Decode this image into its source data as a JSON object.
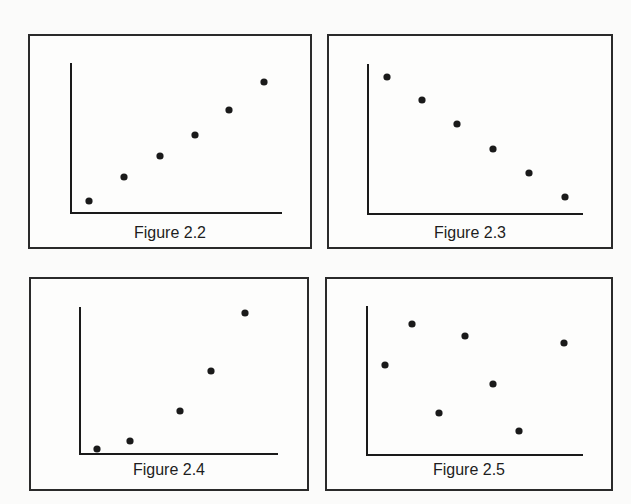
{
  "figures": [
    {
      "caption": "Figure 2.2"
    },
    {
      "caption": "Figure 2.3"
    },
    {
      "caption": "Figure 2.4"
    },
    {
      "caption": "Figure 2.5"
    }
  ],
  "colors": {
    "ink": "#1a1a1a",
    "border": "#2a2a2a",
    "background": "#fbfbfa"
  },
  "chart_data": [
    {
      "type": "scatter",
      "title": "Figure 2.2",
      "xlabel": "",
      "ylabel": "",
      "grid": false,
      "axes": {
        "origin": [
          71,
          213
        ],
        "x_end": 282,
        "y_top": 63
      },
      "points_px": [
        [
          89,
          201
        ],
        [
          124,
          177
        ],
        [
          160,
          156
        ],
        [
          195,
          135
        ],
        [
          229,
          110
        ],
        [
          264,
          82
        ]
      ],
      "x": [
        1,
        2,
        3,
        4,
        5,
        6
      ],
      "y": [
        1,
        2,
        3,
        4,
        5,
        6
      ],
      "note": "Positive linear relationship"
    },
    {
      "type": "scatter",
      "title": "Figure 2.3",
      "xlabel": "",
      "ylabel": "",
      "grid": false,
      "axes": {
        "origin": [
          368,
          214
        ],
        "x_end": 583,
        "y_top": 64
      },
      "points_px": [
        [
          387,
          77
        ],
        [
          422,
          100
        ],
        [
          457,
          124
        ],
        [
          493,
          149
        ],
        [
          529,
          173
        ],
        [
          565,
          197
        ]
      ],
      "x": [
        1,
        2,
        3,
        4,
        5,
        6
      ],
      "y": [
        6,
        5,
        4,
        3,
        2,
        1
      ],
      "note": "Negative linear relationship"
    },
    {
      "type": "scatter",
      "title": "Figure 2.4",
      "xlabel": "",
      "ylabel": "",
      "grid": false,
      "axes": {
        "origin": [
          80,
          454
        ],
        "x_end": 278,
        "y_top": 307
      },
      "points_px": [
        [
          97,
          449
        ],
        [
          130,
          441
        ],
        [
          180,
          411
        ],
        [
          211,
          371
        ],
        [
          245,
          313
        ]
      ],
      "x": [
        1,
        2,
        3.5,
        4.5,
        5.5
      ],
      "y": [
        0.2,
        0.5,
        1.5,
        2.9,
        4.8
      ],
      "note": "Positive curvilinear relationship"
    },
    {
      "type": "scatter",
      "title": "Figure 2.5",
      "xlabel": "",
      "ylabel": "",
      "grid": false,
      "axes": {
        "origin": [
          367,
          455
        ],
        "x_end": 583,
        "y_top": 306
      },
      "points_px": [
        [
          385,
          365
        ],
        [
          412,
          324
        ],
        [
          439,
          413
        ],
        [
          465,
          336
        ],
        [
          493,
          384
        ],
        [
          519,
          431
        ],
        [
          564,
          343
        ]
      ],
      "x": [
        1,
        2,
        3,
        4,
        5,
        6,
        7.5
      ],
      "y": [
        3,
        4.4,
        1.4,
        4,
        2.4,
        0.8,
        3.8
      ],
      "note": "No apparent relationship"
    }
  ]
}
